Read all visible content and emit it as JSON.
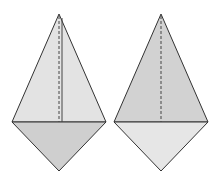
{
  "diagram": {
    "figures": [
      {
        "name": "left-kite",
        "upper_triangle": {
          "points": [
            [
              59,
              14
            ],
            [
              12,
              122
            ],
            [
              106,
              122
            ]
          ],
          "fill": "#e3e3e3"
        },
        "lower_triangle": {
          "points": [
            [
              12,
              122
            ],
            [
              106,
              122
            ],
            [
              59,
              171
            ]
          ],
          "fill": "#cfcfcf"
        },
        "dashed_line": {
          "from": [
            59,
            14
          ],
          "to": [
            59,
            122
          ]
        },
        "solid_line": {
          "from": [
            62,
            14
          ],
          "to": [
            62,
            122
          ]
        }
      },
      {
        "name": "right-kite",
        "upper_triangle": {
          "points": [
            [
              161,
              14
            ],
            [
              114,
              122
            ],
            [
              208,
              122
            ]
          ],
          "fill": "#d2d2d2"
        },
        "lower_triangle": {
          "points": [
            [
              114,
              122
            ],
            [
              208,
              122
            ],
            [
              161,
              171
            ]
          ],
          "fill": "#e6e6e6"
        },
        "dashed_line": {
          "from": [
            161,
            14
          ],
          "to": [
            161,
            122
          ]
        }
      }
    ],
    "colors": {
      "stroke": "#333333",
      "background": "#ffffff"
    }
  }
}
